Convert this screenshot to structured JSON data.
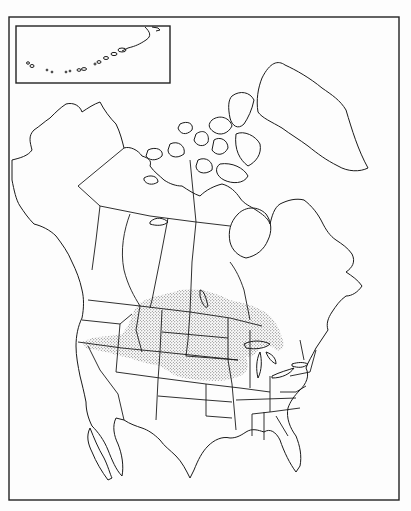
{
  "map": {
    "title": "",
    "subject": "North America outline map with shaded distribution range",
    "region": "North America",
    "has_text_labels": false,
    "colors": {
      "background": "#fdfdfd",
      "outline": "#1a1a1a",
      "range_stipple": "#555555",
      "frame": "#222222"
    },
    "frame": {
      "x": 9,
      "y": 17,
      "width": 390,
      "height": 483
    },
    "inset": {
      "label": "",
      "depicts": "Aleutian Islands",
      "x": 16,
      "y": 26,
      "width": 154,
      "height": 57
    },
    "legend": [],
    "range": {
      "name": "stippled distribution range",
      "covers": [
        "Montana",
        "Wyoming",
        "North Dakota",
        "South Dakota",
        "Nebraska",
        "Colorado (northern)",
        "Idaho (southern)",
        "Utah (northern)",
        "Nevada (northern)",
        "Minnesota (western)",
        "Wisconsin (northern edge)",
        "Upper Michigan (edge)",
        "southern Alberta",
        "southern Saskatchewan",
        "southern Manitoba",
        "Kansas (northern)"
      ]
    }
  }
}
